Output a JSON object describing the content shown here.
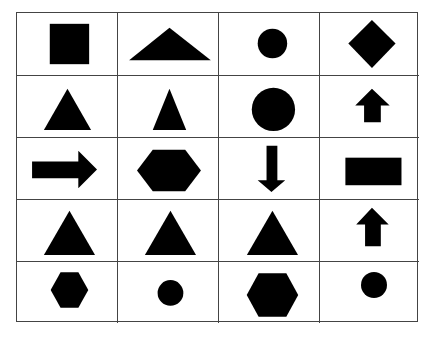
{
  "figure": {
    "rows": 5,
    "columns": 4,
    "fill_color": "#000000",
    "line_color": "#444444",
    "cells": [
      [
        "square",
        "wide-triangle",
        "small-circle",
        "diamond"
      ],
      [
        "triangle",
        "narrow-triangle",
        "large-circle",
        "up-arrow-small"
      ],
      [
        "right-arrow",
        "wide-hexagon",
        "down-arrow",
        "rectangle"
      ],
      [
        "triangle",
        "triangle",
        "triangle",
        "up-arrow"
      ],
      [
        "hexagon-small",
        "small-circle",
        "hexagon",
        "small-circle"
      ]
    ]
  }
}
